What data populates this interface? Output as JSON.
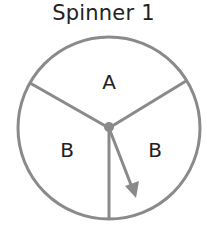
{
  "title": "Spinner 1",
  "spinner": {
    "sections": [
      {
        "label": "A",
        "portion": "1/3"
      },
      {
        "label": "B",
        "portion": "1/3"
      },
      {
        "label": "B",
        "portion": "1/3"
      }
    ],
    "arrow_points_to": "B"
  },
  "colors": {
    "outline": "#8a8a8a",
    "text": "#222222",
    "background": "#ffffff"
  }
}
